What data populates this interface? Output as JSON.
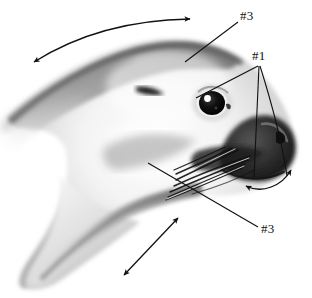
{
  "figure": {
    "background_color": "#ffffff",
    "ink_color": "#111111",
    "rendering": "grayscale pencil/airbrush shaded illustration"
  },
  "labels": [
    {
      "id": "label-top",
      "text": "#3",
      "x": 240,
      "y": 9,
      "points_to": "forehead / top of head",
      "leader_from": [
        238,
        22
      ],
      "leader_to": [
        185,
        62
      ]
    },
    {
      "id": "label-right",
      "text": "#1",
      "x": 252,
      "y": 49,
      "points_to": "eye, whisker pad and nose",
      "leader_from": [
        258,
        66
      ],
      "leader_to": [
        196,
        98
      ]
    },
    {
      "id": "label-bottom",
      "text": "#3",
      "x": 261,
      "y": 222,
      "points_to": "cheek / lower jaw",
      "leader_from": [
        258,
        227
      ],
      "leader_to": [
        148,
        163
      ]
    }
  ],
  "leader_lines": [
    {
      "name": "leader-top-3",
      "from": [
        238,
        22
      ],
      "to": [
        185,
        62
      ]
    },
    {
      "name": "leader-1-eye",
      "from": [
        258,
        66
      ],
      "to": [
        196,
        98
      ]
    },
    {
      "name": "leader-1-whiskers",
      "from": [
        259,
        66
      ],
      "to": [
        254,
        178
      ]
    },
    {
      "name": "leader-1-nose",
      "from": [
        260,
        66
      ],
      "to": [
        286,
        175
      ]
    },
    {
      "name": "leader-bottom-3",
      "from": [
        258,
        227
      ],
      "to": [
        148,
        163
      ]
    }
  ],
  "arrows": [
    {
      "name": "arrow-head-top",
      "style": "curved",
      "heads": "double",
      "from": [
        30,
        57
      ],
      "to": [
        196,
        18
      ],
      "describes": "fore-aft movement over top of head"
    },
    {
      "name": "arrow-jaw-lower",
      "style": "straight",
      "heads": "double",
      "from": [
        122,
        277
      ],
      "to": [
        180,
        216
      ],
      "describes": "movement along lower jaw / throat"
    },
    {
      "name": "arrow-chin",
      "style": "curved",
      "heads": "double",
      "from": [
        243,
        185
      ],
      "to": [
        293,
        168
      ],
      "describes": "movement under muzzle / chin"
    }
  ],
  "anatomy": [
    {
      "name": "eye",
      "cx": 212,
      "cy": 103
    },
    {
      "name": "eye-highlight",
      "cx": 208,
      "cy": 99
    },
    {
      "name": "brow-mark",
      "cx": 150,
      "cy": 91
    },
    {
      "name": "nose-muzzle",
      "cx": 280,
      "cy": 140
    },
    {
      "name": "whisker-fan",
      "cx": 215,
      "cy": 168
    }
  ]
}
